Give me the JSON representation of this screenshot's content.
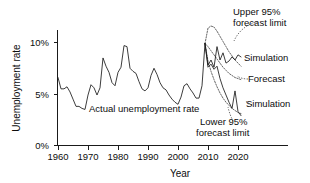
{
  "chart_data": {
    "type": "line",
    "title": "",
    "xlabel": "Year",
    "ylabel": "Unemployment rate",
    "xlim": [
      1960,
      2023
    ],
    "ylim": [
      0,
      12
    ],
    "grid": false,
    "legend_position": "inline-annotations",
    "x_ticks": [
      1960,
      1970,
      1980,
      1990,
      2000,
      2010,
      2020
    ],
    "x_tick_labels": [
      "1960",
      "1970",
      "1980",
      "1990",
      "2000",
      "2010",
      "2020"
    ],
    "y_ticks": [
      0,
      5,
      10
    ],
    "y_tick_labels": [
      "0%",
      "5%",
      "10%"
    ],
    "annotations": [
      {
        "id": "actual",
        "text": "Actual unemployment rate"
      },
      {
        "id": "upper",
        "text_line1": "Upper 95%",
        "text_line2": "forecast limit"
      },
      {
        "id": "lower",
        "text_line1": "Lower 95%",
        "text_line2": "forecast limit"
      },
      {
        "id": "sim_high",
        "text": "Simulation"
      },
      {
        "id": "forecast",
        "text": "Forecast"
      },
      {
        "id": "sim_low",
        "text": "Simulation"
      }
    ],
    "series": [
      {
        "name": "Actual unemployment rate",
        "style": "solid",
        "x": [
          1960,
          1961,
          1962,
          1963,
          1964,
          1965,
          1966,
          1967,
          1968,
          1969,
          1970,
          1971,
          1972,
          1973,
          1974,
          1975,
          1976,
          1977,
          1978,
          1979,
          1980,
          1981,
          1982,
          1983,
          1984,
          1985,
          1986,
          1987,
          1988,
          1989,
          1990,
          1991,
          1992,
          1993,
          1994,
          1995,
          1996,
          1997,
          1998,
          1999,
          2000,
          2001,
          2002,
          2003,
          2004,
          2005,
          2006,
          2007,
          2008,
          2009
        ],
        "values": [
          6.6,
          5.5,
          5.5,
          5.7,
          5.2,
          4.5,
          3.8,
          3.8,
          3.6,
          3.5,
          4.9,
          5.9,
          5.6,
          4.9,
          5.6,
          8.5,
          7.7,
          7.1,
          6.1,
          5.8,
          7.1,
          7.6,
          9.7,
          9.6,
          7.5,
          7.2,
          7.0,
          6.2,
          5.5,
          5.3,
          5.6,
          6.8,
          7.5,
          6.9,
          6.1,
          5.6,
          5.4,
          4.9,
          4.5,
          4.2,
          4.0,
          4.7,
          5.8,
          6.0,
          5.5,
          5.1,
          4.6,
          4.6,
          5.8,
          9.9
        ]
      },
      {
        "name": "Simulation",
        "style": "solid",
        "x": [
          2009,
          2010,
          2011,
          2012,
          2013,
          2014,
          2015,
          2016,
          2017,
          2018,
          2019,
          2020,
          2021
        ],
        "values": [
          9.9,
          7.8,
          8.3,
          7.6,
          9.6,
          8.3,
          9.0,
          8.0,
          8.2,
          8.6,
          8.3,
          8.8,
          8.6
        ]
      },
      {
        "name": "Simulation",
        "style": "solid",
        "x": [
          2009,
          2010,
          2011,
          2012,
          2013,
          2014,
          2015,
          2016,
          2017,
          2018,
          2019,
          2020,
          2021
        ],
        "values": [
          9.9,
          7.6,
          7.9,
          7.4,
          7.7,
          6.5,
          5.6,
          4.9,
          4.2,
          3.6,
          5.3,
          3.3,
          2.9
        ]
      },
      {
        "name": "Upper 95% forecast limit",
        "style": "dotted",
        "x": [
          2009,
          2010,
          2011,
          2012,
          2013,
          2014,
          2015,
          2016,
          2017,
          2018,
          2019,
          2020,
          2021
        ],
        "values": [
          9.9,
          11.4,
          11.6,
          11.5,
          11.1,
          10.6,
          10.1,
          9.6,
          9.1,
          8.7,
          8.3,
          8.0,
          7.7
        ]
      },
      {
        "name": "Lower 95% forecast limit",
        "style": "dotted",
        "x": [
          2009,
          2010,
          2011,
          2012,
          2013,
          2014,
          2015,
          2016,
          2017,
          2018,
          2019,
          2020,
          2021
        ],
        "values": [
          9.9,
          8.2,
          7.2,
          6.4,
          5.7,
          5.1,
          4.6,
          4.2,
          3.9,
          3.6,
          3.4,
          3.2,
          3.1
        ]
      },
      {
        "name": "Forecast",
        "style": "dotted",
        "x": [
          2009,
          2010,
          2011,
          2012,
          2013,
          2014,
          2015,
          2016,
          2017,
          2018,
          2019,
          2020,
          2021
        ],
        "values": [
          9.9,
          9.6,
          9.2,
          8.8,
          8.4,
          8.0,
          7.6,
          7.3,
          7.0,
          6.8,
          6.6,
          6.5,
          6.4
        ]
      }
    ]
  },
  "axes": {
    "y_title": "Unemployment rate",
    "x_title": "Year",
    "y_labels": [
      "10%",
      "5%",
      "0%"
    ],
    "x_labels": [
      "1960",
      "1970",
      "1980",
      "1990",
      "2000",
      "2010",
      "2020"
    ]
  },
  "labels": {
    "actual": "Actual unemployment rate",
    "upper_l1": "Upper 95%",
    "upper_l2": "forecast limit",
    "lower_l1": "Lower 95%",
    "lower_l2": "forecast limit",
    "simulation_upper": "Simulation",
    "forecast": "Forecast",
    "simulation_lower": "Simulation"
  },
  "colors": {
    "ink": "#0d0d0d",
    "line": "#1a1a1a",
    "dotted": "#4a4a4a",
    "background": "#ffffff"
  }
}
